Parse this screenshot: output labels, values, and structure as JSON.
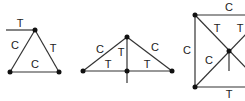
{
  "figures": [
    {
      "id": "triangle-truss",
      "labels": [
        {
          "text": "T",
          "x": 20,
          "y": 24
        },
        {
          "text": "C",
          "x": 15,
          "y": 46
        },
        {
          "text": "T",
          "x": 53,
          "y": 49
        },
        {
          "text": "C",
          "x": 35,
          "y": 65
        }
      ]
    },
    {
      "id": "king-post-truss",
      "labels": [
        {
          "text": "C",
          "x": 100,
          "y": 50
        },
        {
          "text": "C",
          "x": 155,
          "y": 48
        },
        {
          "text": "T",
          "x": 121,
          "y": 53
        },
        {
          "text": "T",
          "x": 108,
          "y": 65
        },
        {
          "text": "T",
          "x": 147,
          "y": 65
        }
      ]
    },
    {
      "id": "cross-braced-frame",
      "labels": [
        {
          "text": "C",
          "x": 229,
          "y": 8
        },
        {
          "text": "C",
          "x": 187,
          "y": 51
        },
        {
          "text": "T",
          "x": 217,
          "y": 29
        },
        {
          "text": "T",
          "x": 240,
          "y": 29
        },
        {
          "text": "C",
          "x": 209,
          "y": 61
        },
        {
          "text": "T",
          "x": 229,
          "y": 95
        }
      ]
    }
  ]
}
